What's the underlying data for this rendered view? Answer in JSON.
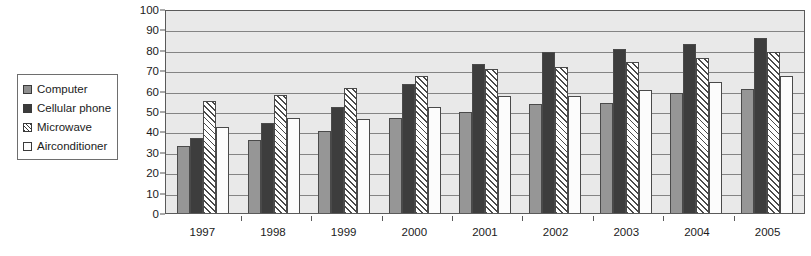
{
  "chart_data": {
    "type": "bar",
    "title": "",
    "subtitle": "",
    "xlabel": "",
    "ylabel": "",
    "ylim": [
      0,
      100
    ],
    "ytick_step": 10,
    "yticks": [
      "100",
      "90",
      "80",
      "70",
      "60",
      "50",
      "40",
      "30",
      "20",
      "10",
      "0"
    ],
    "grid": true,
    "grid_axis": "y",
    "legend_position": "left-outside",
    "categories": [
      "1997",
      "1998",
      "1999",
      "2000",
      "2001",
      "2002",
      "2003",
      "2004",
      "2005"
    ],
    "series": [
      {
        "name": "Computer",
        "swatch": "sw-computer",
        "bar_class": "computer",
        "color": "#969696",
        "values": [
          33,
          36,
          40,
          46.5,
          49.5,
          53.5,
          54,
          59,
          61
        ]
      },
      {
        "name": "Cellular phone",
        "swatch": "sw-cellular",
        "bar_class": "cellular",
        "color": "#3d3d3d",
        "values": [
          37,
          44,
          52,
          63,
          73,
          79,
          80.5,
          83,
          86
        ]
      },
      {
        "name": "Microwave",
        "swatch": "sw-microwave",
        "bar_class": "microwave",
        "color": "#ffffff",
        "values": [
          55,
          58,
          61.5,
          67,
          70.5,
          71.5,
          74,
          76,
          79
        ]
      },
      {
        "name": "Airconditioner",
        "swatch": "sw-aircon",
        "bar_class": "aircon",
        "color": "#fcfcfc",
        "values": [
          42,
          46.5,
          46,
          52,
          57.5,
          57.5,
          60.5,
          64,
          67
        ]
      }
    ]
  },
  "legend": {
    "items": [
      {
        "label": "Computer"
      },
      {
        "label": "Cellular phone"
      },
      {
        "label": "Microwave"
      },
      {
        "label": "Airconditioner"
      }
    ]
  },
  "colors": {
    "plot_background": "#e9e9e9",
    "gridline": "#848484",
    "axis": "#5a5a5a",
    "text": "#1b1b1b",
    "page_background": "#ffffff"
  }
}
